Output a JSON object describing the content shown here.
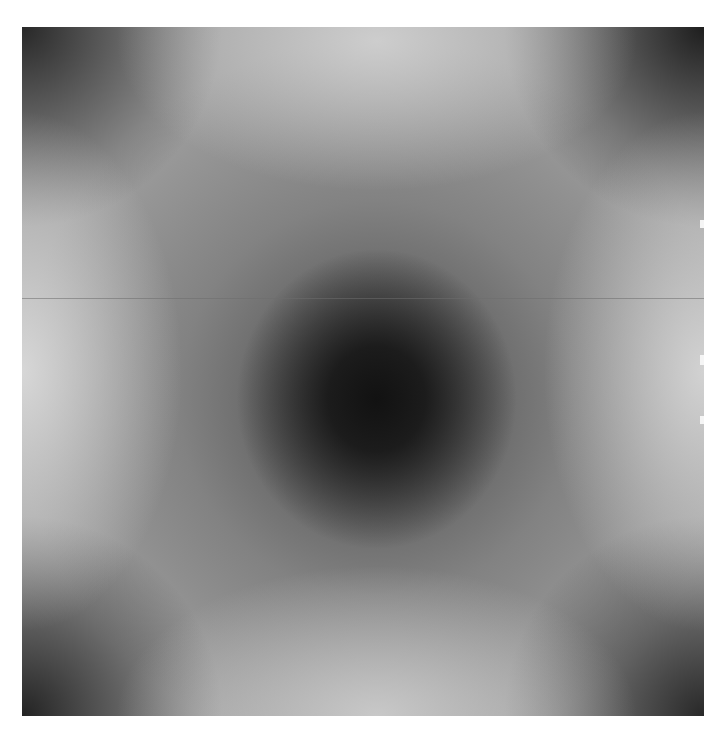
{
  "image": {
    "description": "Grayscale image with a dark circular center, bright regions at top, bottom, left and right edges, and dark corners",
    "colors": {
      "center": "#121212",
      "bright_edges": "#d2d2d2",
      "corners": "#262626",
      "background": "#ffffff"
    },
    "artifacts": {
      "horizontal_line": true
    }
  }
}
